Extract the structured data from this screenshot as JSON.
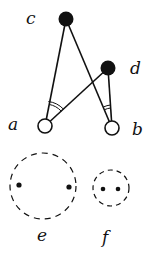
{
  "diagram": {
    "background": "#ffffff",
    "stroke_color": "#111111",
    "nodes": [
      {
        "id": "c",
        "label": "c",
        "cx": 66,
        "cy": 19,
        "r": 7,
        "filled": true,
        "label_x": 29,
        "label_y": 24
      },
      {
        "id": "d",
        "label": "d",
        "cx": 108,
        "cy": 68,
        "r": 7,
        "filled": true,
        "label_x": 132,
        "label_y": 74
      },
      {
        "id": "a",
        "label": "a",
        "cx": 45,
        "cy": 126,
        "r": 7,
        "filled": false,
        "label_x": 10,
        "label_y": 130
      },
      {
        "id": "b",
        "label": "b",
        "cx": 112,
        "cy": 128,
        "r": 7,
        "filled": false,
        "label_x": 133,
        "label_y": 135
      }
    ],
    "edges": [
      {
        "from": "a",
        "to": "c"
      },
      {
        "from": "b",
        "to": "c"
      },
      {
        "from": "a",
        "to": "d"
      },
      {
        "from": "b",
        "to": "d"
      }
    ],
    "angle_marks": [
      {
        "at": "a",
        "between": [
          "c",
          "d"
        ],
        "style": "double-arc"
      },
      {
        "at": "b",
        "between": [
          "c",
          "d"
        ],
        "style": "double-arc"
      }
    ],
    "groups": [
      {
        "id": "e",
        "label": "e",
        "cx": 43,
        "cy": 186,
        "r": 34,
        "style": "dashed",
        "points": [
          {
            "x": 19,
            "y": 185
          },
          {
            "x": 69,
            "y": 187
          }
        ],
        "label_x": 37,
        "label_y": 240
      },
      {
        "id": "f",
        "label": "f",
        "cx": 111,
        "cy": 188,
        "r": 18,
        "style": "dashed",
        "points": [
          {
            "x": 103,
            "y": 189
          },
          {
            "x": 118,
            "y": 189
          }
        ],
        "label_x": 101,
        "label_y": 242
      }
    ]
  }
}
